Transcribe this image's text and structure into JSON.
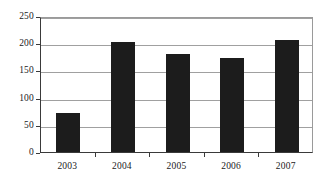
{
  "chart_data": {
    "type": "bar",
    "title": "",
    "subtitle": "",
    "xlabel": "",
    "ylabel": "",
    "categories": [
      "2003",
      "2004",
      "2005",
      "2006",
      "2007"
    ],
    "values": [
      72,
      202,
      181,
      172,
      206
    ],
    "series": [
      {
        "name": "",
        "values": [
          72,
          202,
          181,
          172,
          206
        ]
      }
    ],
    "ylim": [
      0,
      250
    ],
    "yticks": [
      0,
      50,
      100,
      150,
      200,
      250
    ],
    "ytick_labels": [
      "0",
      "50",
      "100",
      "150",
      "200",
      "250"
    ],
    "grid": "horizontal",
    "legend": "none",
    "bar_color": "#1c1c1c",
    "grid_color": "#a0a0a0",
    "axis_color": "#3a3a3a",
    "background": "#ffffff",
    "annotations": []
  }
}
